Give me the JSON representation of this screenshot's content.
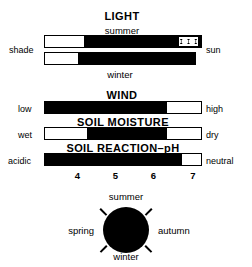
{
  "figure": {
    "background_color": "#ffffff",
    "ink_color": "#000000"
  },
  "light": {
    "title": "LIGHT",
    "top_sublabel": "summer",
    "bottom_sublabel": "winter",
    "left_label": "shade",
    "right_label": "sun",
    "summer_bar": {
      "white_start_pct": 0,
      "black_start_pct": 25,
      "black_end_pct": 100,
      "marker_start_pct": 86,
      "marker_end_pct": 98,
      "marker_glyph_count": 3
    },
    "winter_bar": {
      "white_start_pct": 0,
      "black_start_pct": 22,
      "black_end_pct": 100
    }
  },
  "wind": {
    "title": "WIND",
    "left_label": "low",
    "right_label": "high",
    "black_start_pct": 0,
    "black_end_pct": 78
  },
  "soil_moisture": {
    "title": "SOIL MOISTURE",
    "left_label": "wet",
    "right_label": "dry",
    "black_start_pct": 27,
    "black_end_pct": 78
  },
  "soil_reaction": {
    "title": "SOIL REACTION–pH",
    "left_label": "acidic",
    "right_label": "neutral",
    "black_start_pct": 0,
    "black_end_pct": 88,
    "scale_ticks": [
      {
        "value": "4",
        "pos_pct": 13
      },
      {
        "value": "5",
        "pos_pct": 37
      },
      {
        "value": "6",
        "pos_pct": 61
      },
      {
        "value": "7",
        "pos_pct": 86
      }
    ]
  },
  "season_dial": {
    "top_label": "summer",
    "bottom_label": "winter",
    "left_label": "spring",
    "right_label": "autumn",
    "fill_color": "#000000",
    "tick_count": 4
  }
}
